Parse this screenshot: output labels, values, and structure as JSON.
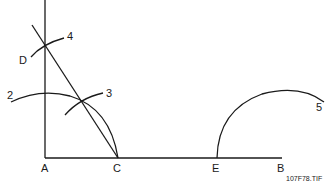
{
  "diagram": {
    "type": "geometric-construction",
    "points": [
      {
        "id": "A",
        "label": "A",
        "x": 45,
        "y": 158
      },
      {
        "id": "C",
        "label": "C",
        "x": 118,
        "y": 158
      },
      {
        "id": "E",
        "label": "E",
        "x": 217,
        "y": 158
      },
      {
        "id": "B",
        "label": "B",
        "x": 282,
        "y": 158
      },
      {
        "id": "D",
        "label": "D",
        "x": 45,
        "y": 44
      }
    ],
    "arc_labels": [
      {
        "id": "2",
        "label": "2"
      },
      {
        "id": "3",
        "label": "3"
      },
      {
        "id": "4",
        "label": "4"
      },
      {
        "id": "5",
        "label": "5"
      }
    ],
    "caption": "107F78.TIF"
  }
}
